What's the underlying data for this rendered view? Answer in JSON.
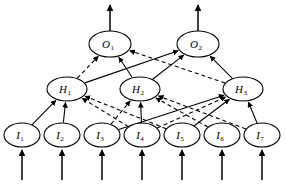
{
  "figure": {
    "type": "neural-network-diagram",
    "title": "",
    "width": 286,
    "height": 184,
    "background_color": "#ffffff",
    "stroke_color": "#000000"
  },
  "layers": [
    {
      "id": "output",
      "name": "Output layer",
      "y": 44,
      "nodes": [
        {
          "id": "O1",
          "label": "O",
          "subscript": "1",
          "x": 110,
          "y": 44,
          "rx": 21,
          "ry": 13
        },
        {
          "id": "O2",
          "label": "O",
          "subscript": "2",
          "x": 198,
          "y": 44,
          "rx": 21,
          "ry": 13
        }
      ]
    },
    {
      "id": "hidden",
      "name": "Hidden layer",
      "y": 89,
      "nodes": [
        {
          "id": "H1",
          "label": "H",
          "subscript": "1",
          "x": 67,
          "y": 89,
          "rx": 20,
          "ry": 12
        },
        {
          "id": "H2",
          "label": "H",
          "subscript": "2",
          "x": 140,
          "y": 89,
          "rx": 20,
          "ry": 12
        },
        {
          "id": "H3",
          "label": "H",
          "subscript": "3",
          "x": 243,
          "y": 89,
          "rx": 20,
          "ry": 12
        }
      ]
    },
    {
      "id": "input",
      "name": "Input layer",
      "y": 135,
      "nodes": [
        {
          "id": "I1",
          "label": "I",
          "subscript": "1",
          "x": 22,
          "y": 135,
          "rx": 18,
          "ry": 12
        },
        {
          "id": "I2",
          "label": "I",
          "subscript": "2",
          "x": 62,
          "y": 135,
          "rx": 18,
          "ry": 12
        },
        {
          "id": "I3",
          "label": "I",
          "subscript": "3",
          "x": 102,
          "y": 135,
          "rx": 18,
          "ry": 12
        },
        {
          "id": "I4",
          "label": "I",
          "subscript": "4",
          "x": 142,
          "y": 135,
          "rx": 18,
          "ry": 12
        },
        {
          "id": "I5",
          "label": "I",
          "subscript": "5",
          "x": 182,
          "y": 135,
          "rx": 18,
          "ry": 12
        },
        {
          "id": "I6",
          "label": "I",
          "subscript": "6",
          "x": 222,
          "y": 135,
          "rx": 18,
          "ry": 12
        },
        {
          "id": "I7",
          "label": "I",
          "subscript": "7",
          "x": 262,
          "y": 135,
          "rx": 18,
          "ry": 12
        }
      ]
    }
  ],
  "edges": [
    {
      "from": "H1",
      "to": "O1",
      "style": "dashed",
      "arrow": true
    },
    {
      "from": "H2",
      "to": "O1",
      "style": "solid",
      "arrow": true
    },
    {
      "from": "H3",
      "to": "O1",
      "style": "dashed",
      "arrow": true
    },
    {
      "from": "H1",
      "to": "O2",
      "style": "solid",
      "arrow": true
    },
    {
      "from": "H2",
      "to": "O2",
      "style": "solid",
      "arrow": true
    },
    {
      "from": "H3",
      "to": "O2",
      "style": "solid",
      "arrow": true
    },
    {
      "from": "I1",
      "to": "H1",
      "style": "solid",
      "arrow": true
    },
    {
      "from": "I2",
      "to": "H1",
      "style": "solid",
      "arrow": true
    },
    {
      "from": "I4",
      "to": "H1",
      "style": "dashed",
      "arrow": true
    },
    {
      "from": "I5",
      "to": "H1",
      "style": "dashed",
      "arrow": true
    },
    {
      "from": "I3",
      "to": "H2",
      "style": "dashed",
      "arrow": true
    },
    {
      "from": "I4",
      "to": "H2",
      "style": "solid",
      "arrow": true
    },
    {
      "from": "I6",
      "to": "H2",
      "style": "dashed",
      "arrow": true
    },
    {
      "from": "I7",
      "to": "H2",
      "style": "dashed",
      "arrow": true
    },
    {
      "from": "I3",
      "to": "H3",
      "style": "solid",
      "arrow": true
    },
    {
      "from": "I4",
      "to": "H3",
      "style": "dashed",
      "arrow": true
    },
    {
      "from": "I5",
      "to": "H3",
      "style": "solid",
      "arrow": true
    },
    {
      "from": "I7",
      "to": "H3",
      "style": "solid",
      "arrow": true
    }
  ],
  "external_arrows": {
    "outputs": [
      {
        "node": "O1",
        "x": 110,
        "from_y": 31,
        "to_y": 5,
        "direction": "up"
      },
      {
        "node": "O2",
        "x": 198,
        "from_y": 31,
        "to_y": 5,
        "direction": "up"
      }
    ],
    "inputs": [
      {
        "node": "I1",
        "x": 22,
        "from_y": 180,
        "to_y": 150,
        "direction": "up"
      },
      {
        "node": "I2",
        "x": 62,
        "from_y": 180,
        "to_y": 150,
        "direction": "up"
      },
      {
        "node": "I3",
        "x": 102,
        "from_y": 180,
        "to_y": 150,
        "direction": "up"
      },
      {
        "node": "I4",
        "x": 142,
        "from_y": 180,
        "to_y": 150,
        "direction": "up"
      },
      {
        "node": "I5",
        "x": 182,
        "from_y": 180,
        "to_y": 150,
        "direction": "up"
      },
      {
        "node": "I6",
        "x": 222,
        "from_y": 180,
        "to_y": 150,
        "direction": "up"
      },
      {
        "node": "I7",
        "x": 262,
        "from_y": 180,
        "to_y": 150,
        "direction": "up"
      }
    ]
  },
  "legend": {
    "solid": "solid connection",
    "dashed": "dashed connection"
  }
}
